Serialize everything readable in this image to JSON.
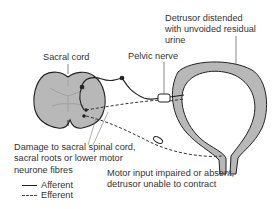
{
  "diagram": {
    "type": "anatomical-schematic",
    "colors": {
      "tissue_fill": "#b8b8b8",
      "outline": "#222222",
      "nerve_line": "#222222",
      "label_text": "#333333",
      "background": "#ffffff"
    }
  },
  "labels": {
    "sacral_cord": "Sacral cord",
    "pelvic_nerve": "Pelvic nerve",
    "detrusor": [
      "Detrusor distended",
      "with unvoided residual",
      "urine"
    ],
    "damage": [
      "Damage to sacral spinal cord,",
      "sacral roots or lower motor",
      "neurone fibres"
    ],
    "motor": [
      "Motor input impaired or absent,",
      "detrusor unable to contract"
    ]
  },
  "legend": {
    "items": [
      {
        "style": "solid",
        "label": "Afferent"
      },
      {
        "style": "dashed",
        "label": "Efferent"
      }
    ]
  }
}
